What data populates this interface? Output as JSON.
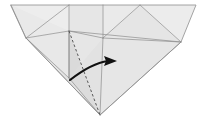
{
  "figure": {
    "kind": "origami-fold-step",
    "background_color": "#ffffff",
    "canvas": {
      "width": 207,
      "height": 124
    }
  },
  "palette": {
    "paper_light": "#ececec",
    "paper_mid": "#e2e2e2",
    "paper_dark": "#d8d8d8",
    "paper_shadow": "#cfcfcf",
    "crease_line": "#8d8d8d",
    "outline_line": "#9a9a9a",
    "valley_dash": "#4a4a4a",
    "arrow_color": "#111111"
  },
  "vertices": {
    "top_left": {
      "x": 11,
      "y": 5
    },
    "top_mid_left": {
      "x": 69,
      "y": 5
    },
    "top_center": {
      "x": 103,
      "y": 5
    },
    "top_mid_right": {
      "x": 140,
      "y": 5
    },
    "top_right": {
      "x": 196,
      "y": 5
    },
    "left_node": {
      "x": 26,
      "y": 38
    },
    "apex_node": {
      "x": 69,
      "y": 31
    },
    "center_node": {
      "x": 103,
      "y": 38
    },
    "right_node": {
      "x": 181,
      "y": 42
    },
    "mid_node": {
      "x": 69,
      "y": 78
    },
    "bottom_apex": {
      "x": 100,
      "y": 115
    }
  },
  "faces": [
    {
      "name": "upper-left-panel",
      "fill": "#ececec"
    },
    {
      "name": "upper-mid-panel",
      "fill": "#e6e6e6"
    },
    {
      "name": "upper-right-panel",
      "fill": "#ebebeb"
    },
    {
      "name": "left-wing-panel",
      "fill": "#e4e4e4"
    },
    {
      "name": "right-wing-panel",
      "fill": "#e7e7e7"
    },
    {
      "name": "center-flap-panel",
      "fill": "#dcdcdc"
    },
    {
      "name": "lower-flap-panel",
      "fill": "#d6d6d6"
    }
  ],
  "creases": [
    {
      "name": "crease-topleft-to-leftnode",
      "type": "solid"
    },
    {
      "name": "crease-leftnode-to-apex",
      "type": "solid"
    },
    {
      "name": "crease-leftnode-to-midnode",
      "type": "solid"
    },
    {
      "name": "crease-leftnode-to-bottom",
      "type": "solid"
    },
    {
      "name": "crease-apex-to-centernode",
      "type": "solid"
    },
    {
      "name": "crease-apex-to-rightnode",
      "type": "solid"
    },
    {
      "name": "crease-apex-to-midnode",
      "type": "solid"
    },
    {
      "name": "crease-centernode-to-top",
      "type": "solid"
    },
    {
      "name": "crease-centernode-to-right",
      "type": "solid"
    },
    {
      "name": "crease-rightnode-to-bottom",
      "type": "solid"
    },
    {
      "name": "crease-midnode-to-bottom",
      "type": "solid"
    },
    {
      "name": "crease-topmidleft-to-leftnode",
      "type": "solid"
    },
    {
      "name": "crease-topmidright-to-right",
      "type": "solid"
    },
    {
      "name": "crease-apex-to-bottom",
      "type": "dashed"
    }
  ],
  "annotations": {
    "fold_arrow": {
      "name": "fold-direction-arrow",
      "style": "curved-solid-arrow",
      "meaning": "fold the flap over to the right",
      "start": {
        "x": 70,
        "y": 80
      },
      "end": {
        "x": 116,
        "y": 61
      },
      "color": "#111111"
    }
  }
}
